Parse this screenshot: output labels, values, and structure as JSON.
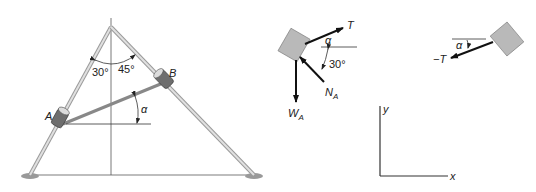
{
  "figure": {
    "structure": {
      "left_angle_label": "30°",
      "right_angle_label": "45°",
      "collar_a_label": "A",
      "collar_b_label": "B",
      "alpha_label": "α"
    },
    "fbd_a": {
      "tension_label": "T",
      "alpha_label": "α",
      "angle_label": "30°",
      "normal_label": "N",
      "normal_sub": "A",
      "weight_label": "W",
      "weight_sub": "A"
    },
    "fbd_b": {
      "tension_label": "−T",
      "alpha_label": "α",
      "angle_label": "45°",
      "normal_label": "N",
      "normal_sub": "B",
      "weight_label": "W",
      "weight_sub": "B"
    },
    "axes": {
      "x_label": "x",
      "y_label": "y"
    }
  },
  "colors": {
    "rod": "#c9c9c9",
    "rod_edge": "#9a9a9a",
    "collar": "#777777",
    "block": "#b9b9b9",
    "line": "#333333",
    "arrow": "#111111"
  }
}
